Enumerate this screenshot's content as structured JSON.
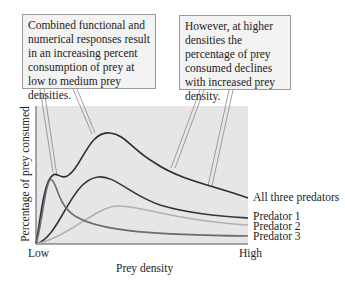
{
  "annotations": [
    {
      "text": "Combined functional and numerical responses result in an increasing percent consumption of prey at low to medium prey densities."
    },
    {
      "text": "However, at higher densities the percentage of prey consumed declines with increased prey density."
    }
  ],
  "axes": {
    "ylabel": "Percentage of prey consumed",
    "xlabel": "Prey density",
    "x_low": "Low",
    "x_high": "High"
  },
  "series_labels": {
    "all": "All three predators",
    "p1": "Predator 1",
    "p2": "Predator 2",
    "p3": "Predator 3"
  },
  "colors": {
    "plot_bg": "#e6e6e6",
    "all": "#2b2b3a",
    "p1": "#3a3045",
    "p2": "#b0b0b0",
    "p3": "#6a6a70"
  }
}
